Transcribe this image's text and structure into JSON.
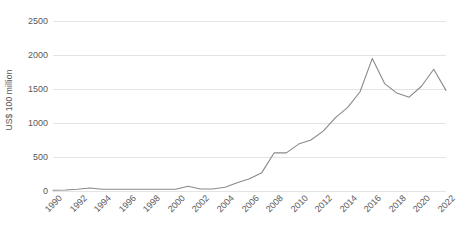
{
  "chart_data": {
    "type": "line",
    "title": "",
    "subtitle": "",
    "xlabel": "",
    "ylabel": "US$ 100 million",
    "xlim": [
      1990,
      2022
    ],
    "ylim": [
      0,
      2500
    ],
    "grid": true,
    "legend": false,
    "legend_position": "none",
    "line_color": "#8a8a8a",
    "gridline_color": "#e4e4e4",
    "background_color": "#ffffff",
    "axis_text_color": "#595959",
    "y_ticks": [
      0,
      500,
      1000,
      1500,
      2000,
      2500
    ],
    "y_tick_labels": [
      "0",
      "500",
      "1000",
      "1500",
      "2000",
      "2500"
    ],
    "x_ticks": [
      1990,
      1992,
      1994,
      1996,
      1998,
      2000,
      2002,
      2004,
      2006,
      2008,
      2010,
      2012,
      2014,
      2016,
      2018,
      2020,
      2022
    ],
    "x_tick_labels": [
      "1990",
      "1992",
      "1994",
      "1996",
      "1998",
      "2000",
      "2002",
      "2004",
      "2006",
      "2008",
      "2010",
      "2012",
      "2014",
      "2016",
      "2018",
      "2020",
      "2022"
    ],
    "series": [
      {
        "name": "US$ 100 million",
        "x": [
          1990,
          1991,
          1992,
          1993,
          1994,
          1995,
          1996,
          1997,
          1998,
          1999,
          2000,
          2001,
          2002,
          2003,
          2004,
          2005,
          2006,
          2007,
          2008,
          2009,
          2010,
          2011,
          2012,
          2013,
          2014,
          2015,
          2016,
          2017,
          2018,
          2019,
          2020,
          2021,
          2022
        ],
        "values": [
          10,
          15,
          25,
          45,
          25,
          25,
          25,
          25,
          25,
          25,
          25,
          70,
          30,
          30,
          55,
          120,
          180,
          270,
          560,
          560,
          690,
          750,
          880,
          1080,
          1230,
          1460,
          1950,
          1580,
          1440,
          1380,
          1540,
          1790,
          1480
        ]
      }
    ]
  }
}
